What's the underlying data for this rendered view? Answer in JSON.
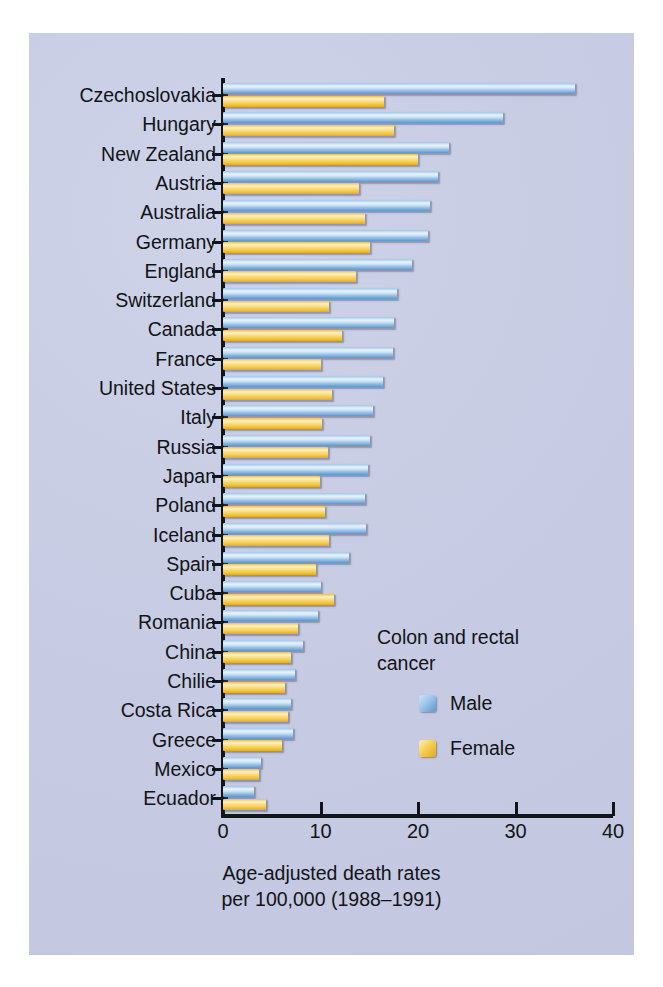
{
  "chart_data": {
    "type": "bar",
    "orientation": "horizontal",
    "title": "",
    "xlabel": "Age-adjusted death rates per 100,000 (1988–1991)",
    "ylabel": "",
    "xlim": [
      0,
      40
    ],
    "xticks": [
      0,
      10,
      20,
      30,
      40
    ],
    "grid": false,
    "legend_position": "inside-right",
    "legend_title": "Colon and rectal cancer",
    "categories": [
      "Czechoslovakia",
      "Hungary",
      "New Zealand",
      "Austria",
      "Australia",
      "Germany",
      "England",
      "Switzerland",
      "Canada",
      "France",
      "United States",
      "Italy",
      "Russia",
      "Japan",
      "Poland",
      "Iceland",
      "Spain",
      "Cuba",
      "Romania",
      "China",
      "Chilie",
      "Costa Rica",
      "Greece",
      "Mexico",
      "Ecuador"
    ],
    "series": [
      {
        "name": "Male",
        "color": "#8cb9e2",
        "values": [
          36.1,
          28.7,
          23.2,
          22.0,
          21.2,
          21.0,
          19.4,
          17.8,
          17.5,
          17.4,
          16.4,
          15.4,
          15.1,
          14.9,
          14.6,
          14.7,
          12.9,
          10.0,
          9.7,
          8.2,
          7.4,
          7.0,
          7.2,
          3.9,
          3.2
        ]
      },
      {
        "name": "Female",
        "color": "#f5cb4e",
        "values": [
          16.5,
          17.5,
          20.0,
          13.9,
          14.6,
          15.1,
          13.6,
          10.9,
          12.2,
          10.0,
          11.2,
          10.2,
          10.8,
          9.9,
          10.5,
          10.9,
          9.5,
          11.4,
          7.7,
          7.0,
          6.4,
          6.7,
          6.0,
          3.7,
          4.4
        ]
      }
    ],
    "caption_lines": [
      "Age-adjusted death rates",
      "per 100,000 (1988–1991)"
    ]
  },
  "legend": {
    "title_lines": [
      "Colon and rectal",
      "cancer"
    ],
    "entries": [
      {
        "label": "Male",
        "swatch": "male-swatch"
      },
      {
        "label": "Female",
        "swatch": "female-swatch"
      }
    ]
  },
  "axis": {
    "tick_labels": [
      "0",
      "10",
      "20",
      "30",
      "40"
    ]
  },
  "colors": {
    "panel_background": "#c9cde4",
    "figure_background": "#ffffff",
    "axis": "#111418",
    "male_bar": "#8cb9e2",
    "female_bar": "#f5cb4e",
    "text": "#111318"
  }
}
